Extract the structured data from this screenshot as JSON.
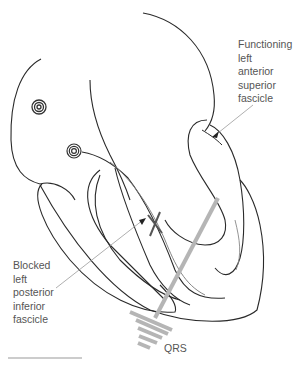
{
  "diagram": {
    "labels": {
      "functioning": [
        "Functioning",
        "left",
        "anterior",
        "superior",
        "fascicle"
      ],
      "blocked": [
        "Blocked",
        "left",
        "posterior",
        "inferior",
        "fascicle"
      ],
      "qrs": "QRS"
    },
    "colors": {
      "outline": "#2a2a2a",
      "leader": "#9a9a9a",
      "qrs_vector": "#b5b5b5",
      "block_mark": "#555555",
      "text": "#555555"
    },
    "icons": [
      "sa-node-spiral-icon",
      "av-node-spiral-icon",
      "block-cross-icon",
      "arrowhead-icon",
      "qrs-ground-icon"
    ]
  }
}
